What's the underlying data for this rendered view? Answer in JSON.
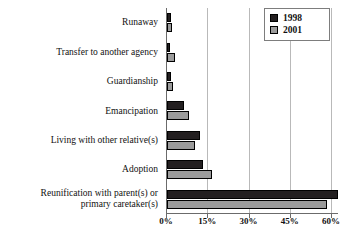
{
  "chart_data": {
    "type": "bar",
    "orientation": "horizontal",
    "title": "",
    "subtitle": "",
    "xlabel": "",
    "ylabel": "",
    "xlim": [
      0,
      62.5
    ],
    "grid": true,
    "legend_position": "top-right",
    "xticks": [
      "0%",
      "15%",
      "30%",
      "45%",
      "60%"
    ],
    "xtick_values": [
      0,
      15,
      30,
      45,
      60
    ],
    "categories": [
      "Runaway",
      "Transfer to another agency",
      "Guardianship",
      "Emancipation",
      "Living with other relative(s)",
      "Adoption",
      "Reunification with parent(s) or primary caretaker(s)"
    ],
    "category_lines": [
      [
        "Runaway"
      ],
      [
        "Transfer to another agency"
      ],
      [
        "Guardianship"
      ],
      [
        "Emancipation"
      ],
      [
        "Living with other relative(s)"
      ],
      [
        "Adoption"
      ],
      [
        "Reunification with parent(s) or",
        "primary caretaker(s)"
      ]
    ],
    "series": [
      {
        "name": "1998",
        "color": "#231f20",
        "values": [
          1.5,
          1.2,
          1.5,
          6.0,
          12.0,
          13.0,
          62.0
        ]
      },
      {
        "name": "2001",
        "color": "#9b9b9b",
        "values": [
          1.8,
          2.8,
          2.2,
          8.0,
          10.0,
          16.5,
          58.0
        ]
      }
    ]
  },
  "legend": {
    "entries": [
      {
        "label": "1998",
        "color": "#231f20"
      },
      {
        "label": "2001",
        "color": "#9b9b9b"
      }
    ]
  }
}
